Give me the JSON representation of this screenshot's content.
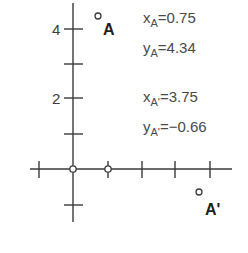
{
  "diagram": {
    "y_tick_labels": [
      {
        "value": 4,
        "label": "4"
      },
      {
        "value": 2,
        "label": "2"
      }
    ],
    "points": [
      {
        "name": "A",
        "label": "A",
        "x": 0.75,
        "y": 4.34
      },
      {
        "name": "A'",
        "label": "A'",
        "x": 3.75,
        "y": -0.66
      }
    ],
    "annotations": [
      {
        "var": "x",
        "sub": "A",
        "eq": "=0.75"
      },
      {
        "var": "y",
        "sub": "A",
        "eq": "=4.34"
      },
      {
        "var": "x",
        "sub": "A'",
        "eq": "=3.75"
      },
      {
        "var": "y",
        "sub": "A'",
        "eq": "=−0.66"
      }
    ],
    "axis_markers": [
      {
        "x": 0,
        "y": 0,
        "label": "origin"
      },
      {
        "x": 1,
        "y": 0,
        "label": "unit-x"
      }
    ],
    "colors": {
      "axis": "#3a3a3a",
      "text": "#4a4a4a",
      "label": "#1e1e1e"
    }
  }
}
